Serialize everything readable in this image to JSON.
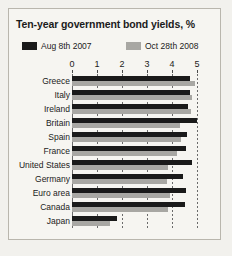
{
  "chart_data": {
    "type": "bar",
    "orientation": "horizontal",
    "title": "Ten-year government bond yields, %",
    "xlabel": "",
    "ylabel": "",
    "xlim": [
      0,
      5
    ],
    "xticks": [
      0,
      1,
      2,
      3,
      4,
      5
    ],
    "grid": true,
    "grid_axis": "x",
    "axis_position": "top",
    "legend_position": "top",
    "categories": [
      "Greece",
      "Italy",
      "Ireland",
      "Britain",
      "Spain",
      "France",
      "United States",
      "Germany",
      "Euro area",
      "Canada",
      "Japan"
    ],
    "series": [
      {
        "name": "Aug 8th 2007",
        "color": "#1a1a1a",
        "values": [
          4.7,
          4.7,
          4.65,
          5.0,
          4.6,
          4.55,
          4.8,
          4.45,
          4.55,
          4.5,
          1.8
        ]
      },
      {
        "name": "Oct 28th 2008",
        "color": "#a8a7a3",
        "values": [
          4.9,
          4.8,
          4.75,
          4.3,
          4.35,
          4.2,
          3.85,
          3.8,
          3.9,
          3.85,
          1.5
        ]
      }
    ]
  },
  "legend": [
    {
      "label": "Aug 8th 2007",
      "color": "#1a1a1a"
    },
    {
      "label": "Oct 28th 2008",
      "color": "#a8a7a3"
    }
  ]
}
